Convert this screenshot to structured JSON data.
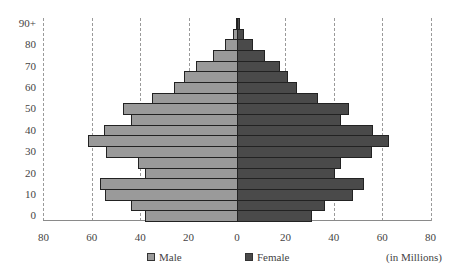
{
  "chart_data": {
    "type": "bar",
    "orientation": "horizontal",
    "subtype": "population-pyramid",
    "title": "",
    "xlabel": "",
    "ylabel": "",
    "units_note": "(in Millions)",
    "categories": [
      "90+",
      "85",
      "80",
      "75",
      "70",
      "65",
      "60",
      "55",
      "50",
      "45",
      "40",
      "35",
      "30",
      "25",
      "20",
      "15",
      "10",
      "5",
      "0"
    ],
    "y_tick_labels": [
      "90+",
      "80",
      "70",
      "60",
      "50",
      "40",
      "30",
      "20",
      "10",
      "0"
    ],
    "x_tick_labels": [
      "80",
      "60",
      "40",
      "20",
      "0",
      "20",
      "40",
      "60",
      "80"
    ],
    "xlim": [
      -80,
      80
    ],
    "grid": "vertical dashed",
    "legend_position": "bottom",
    "series": [
      {
        "name": "Male",
        "color": "#9a9a9a",
        "values": [
          0.5,
          1.6,
          5,
          10,
          17,
          21.7,
          26,
          35,
          47,
          44,
          55,
          61.5,
          54,
          40.8,
          38,
          56.6,
          54.4,
          43.7,
          38
        ]
      },
      {
        "name": "Female",
        "color": "#4a4a4a",
        "values": [
          1.2,
          2.9,
          6.7,
          11.6,
          17.6,
          21,
          24.8,
          33.6,
          46.3,
          43,
          56,
          63,
          55.6,
          43,
          40.6,
          52.5,
          47.8,
          36.5,
          30.8
        ]
      }
    ]
  },
  "legend": {
    "male_label": "Male",
    "female_label": "Female",
    "units_label": "(in Millions)"
  }
}
